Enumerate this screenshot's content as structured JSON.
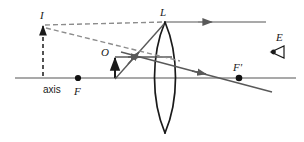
{
  "figure": {
    "kind": "ray-diagram",
    "background_color": "#ffffff",
    "width": 304,
    "height": 142
  },
  "colors": {
    "axis": "#8c8c8c",
    "ray_solid": "#595959",
    "ray_dashed": "#8c8c8c",
    "lens_outline": "#1a1a1a",
    "label": "#1a1a1a",
    "point_fill": "#111111",
    "object_arrow": "#1a1a1a"
  },
  "labels": {
    "image_point": "I",
    "lens_top": "L",
    "object_point": "O",
    "focal_near": "F",
    "focal_far": "F'",
    "eye": "E",
    "axis": "axis"
  },
  "geometry": {
    "axis": {
      "x1": 15,
      "y": 78,
      "x2": 296
    },
    "lens": {
      "top_x": 165,
      "top_y": 22,
      "bottom_x": 165,
      "bottom_y": 133,
      "bulge": 14,
      "center_x": 165
    },
    "object_arrow": {
      "x": 115,
      "base_y": 78,
      "tip_y": 57
    },
    "image_dashed_vertical": {
      "x": 43,
      "top_y": 25,
      "bottom_y": 78
    },
    "points": [
      {
        "name": "F",
        "x": 78,
        "y": 78
      },
      {
        "name": "F-prime",
        "x": 239,
        "y": 78
      }
    ],
    "rays": [
      {
        "name": "axial-ray-O-to-lens",
        "type": "solid",
        "x1": 115,
        "y1": 57,
        "x2": 170,
        "y2": 57
      },
      {
        "name": "oblique-ray-O-to-L",
        "type": "solid",
        "x1": 115,
        "y1": 78,
        "x2": 164,
        "y2": 23
      },
      {
        "name": "refracted-ray-horizontal",
        "type": "solid",
        "x1": 166,
        "y1": 22,
        "x2": 266,
        "y2": 22
      },
      {
        "name": "refracted-ray-through-F-prime",
        "type": "solid",
        "x1": 120,
        "y1": 53,
        "x2": 270,
        "y2": 90
      },
      {
        "name": "virtual-extension-horizontal",
        "type": "dashed",
        "x1": 44,
        "y1": 25,
        "x2": 164,
        "y2": 22
      },
      {
        "name": "virtual-extension-oblique",
        "type": "dashed",
        "x1": 44,
        "y1": 27,
        "x2": 178,
        "y2": 60
      }
    ],
    "eye": {
      "x": 277,
      "y": 52,
      "label_x": 280,
      "label_y": 40
    }
  },
  "arrowheads": [
    {
      "name": "image-tip-arrow",
      "x": 44,
      "y": 26
    },
    {
      "name": "object-tip-arrow",
      "x": 115,
      "y": 57
    },
    {
      "name": "axial-ray-arrow",
      "x": 143,
      "y": 57
    },
    {
      "name": "oblique-ray-arrow",
      "x": 143,
      "y": 41
    },
    {
      "name": "refracted-horizontal-arrow",
      "x": 213,
      "y": 22
    },
    {
      "name": "refracted-oblique-arrow",
      "x": 207,
      "y": 72
    }
  ]
}
